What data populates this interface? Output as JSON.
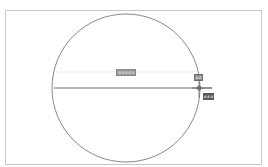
{
  "drawing": {
    "circle": {
      "cx": 126,
      "cy": 88,
      "r": 74,
      "stroke": "#6a6a6a"
    },
    "diameter_line": {
      "x1": 54,
      "y1": 88,
      "x2": 212,
      "y2": 88,
      "stroke": "#4a4a4a"
    },
    "dimension_guide": {
      "x1": 54,
      "y1": 72,
      "x2": 198,
      "y2": 72,
      "stroke": "#cfcfcf"
    },
    "cursor": {
      "x": 199,
      "y": 88
    }
  },
  "dynamic_input": {
    "length_value": "######",
    "angle_value": "##",
    "snap_label": "###"
  },
  "colors": {
    "frame_border": "#c8c8c8",
    "background": "#ffffff",
    "tooltip_dark": "#5a5a5a",
    "tooltip_mid": "#8c8c8c"
  }
}
